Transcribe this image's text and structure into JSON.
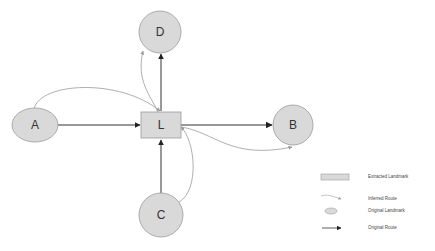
{
  "diagram": {
    "colors": {
      "landmark_fill": "#d9d9d9",
      "landmark_stroke": "#9a9a9a",
      "original_route": "#333333",
      "inferred_route": "#9a9a9a",
      "background": "#ffffff"
    },
    "nodes": {
      "A": {
        "label": "A",
        "type": "original-landmark"
      },
      "B": {
        "label": "B",
        "type": "original-landmark"
      },
      "C": {
        "label": "C",
        "type": "original-landmark"
      },
      "D": {
        "label": "D",
        "type": "original-landmark"
      },
      "L": {
        "label": "L",
        "type": "extracted-landmark"
      }
    },
    "edges": [
      {
        "from": "A",
        "to": "L",
        "type": "original-route"
      },
      {
        "from": "L",
        "to": "B",
        "type": "original-route"
      },
      {
        "from": "C",
        "to": "L",
        "type": "original-route"
      },
      {
        "from": "L",
        "to": "D",
        "type": "original-route"
      },
      {
        "from": "A",
        "to": "L",
        "type": "inferred-route"
      },
      {
        "from": "L",
        "to": "D",
        "type": "inferred-route"
      },
      {
        "from": "L",
        "to": "B",
        "type": "inferred-route"
      },
      {
        "from": "C",
        "to": "L",
        "type": "inferred-route"
      }
    ],
    "legend": {
      "items": [
        {
          "label": "Extracted Landmark",
          "icon": "rectangle"
        },
        {
          "label": "Inferred Route",
          "icon": "thin-gray-arrow"
        },
        {
          "label": "Original Landmark",
          "icon": "ellipse"
        },
        {
          "label": "Original Route",
          "icon": "dark-arrow"
        }
      ]
    }
  }
}
